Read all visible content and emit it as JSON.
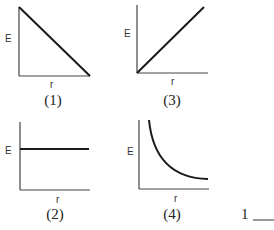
{
  "graphs": [
    {
      "id": "1",
      "caption": "(1)",
      "y_label": "E",
      "x_label": "r",
      "shape": "linear-decreasing",
      "description": "E decreases linearly with r"
    },
    {
      "id": "3",
      "caption": "(3)",
      "y_label": "E",
      "x_label": "r",
      "shape": "linear-increasing",
      "description": "E increases linearly with r from origin"
    },
    {
      "id": "2",
      "caption": "(2)",
      "y_label": "E",
      "x_label": "r",
      "shape": "constant",
      "description": "E constant with r"
    },
    {
      "id": "4",
      "caption": "(4)",
      "y_label": "E",
      "x_label": "r",
      "shape": "inverse-decreasing",
      "description": "E decreases inversely with r"
    }
  ],
  "answer": {
    "number": "1",
    "blank": "___"
  },
  "colors": {
    "axis": "#333333",
    "curve": "#1a1a1a"
  }
}
